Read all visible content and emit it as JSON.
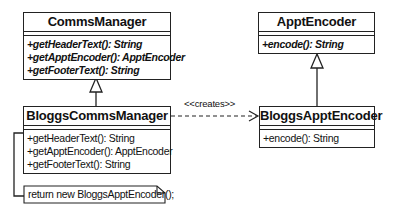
{
  "classes": {
    "comms_manager": {
      "name": "CommsManager",
      "abstract": true,
      "operations": [
        "+getHeaderText(): String",
        "+getApptEncoder(): ApptEncoder",
        "+getFooterText(): String"
      ]
    },
    "bloggs_comms_manager": {
      "name": "BloggsCommsManager",
      "abstract": false,
      "operations": [
        "+getHeaderText(): String",
        "+getApptEncoder(): ApptEncoder",
        "+getFooterText(): String"
      ]
    },
    "appt_encoder": {
      "name": "ApptEncoder",
      "abstract": true,
      "operations": [
        "+encode(): String"
      ]
    },
    "bloggs_appt_encoder": {
      "name": "BloggsApptEncoder",
      "abstract": false,
      "operations": [
        "+encode(): String"
      ]
    }
  },
  "relations": {
    "creates_label": "<<creates>>"
  },
  "note": {
    "text": "return new BloggsApptEncoder();"
  }
}
